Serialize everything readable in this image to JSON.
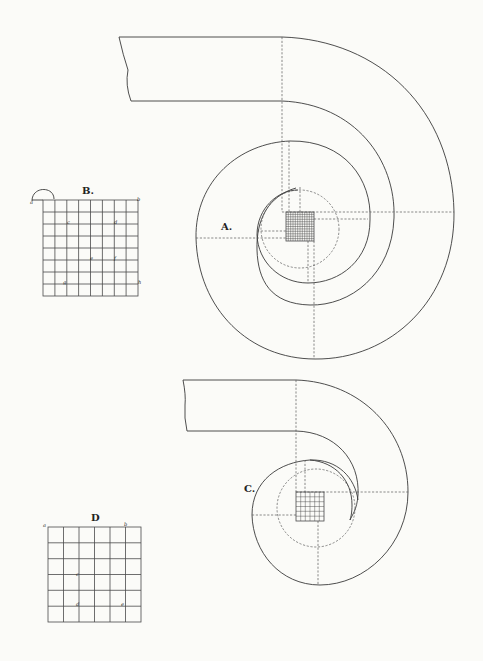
{
  "figure": {
    "type": "technical-drawing",
    "labels": {
      "A": "A.",
      "B": "B.",
      "C": "C.",
      "D": "D"
    },
    "grid_B": {
      "title": "B.",
      "columns": 8,
      "rows": 8,
      "point_labels": [
        "a",
        "b",
        "c",
        "d",
        "e",
        "f",
        "g",
        "h"
      ]
    },
    "grid_D": {
      "title": "D",
      "columns": 6,
      "rows": 6,
      "point_labels": [
        "a",
        "b",
        "c",
        "d",
        "e"
      ]
    },
    "volute_A": {
      "label": "A.",
      "eye_grid": "12x12"
    },
    "volute_C": {
      "label": "C.",
      "eye_grid": "6x6"
    }
  }
}
